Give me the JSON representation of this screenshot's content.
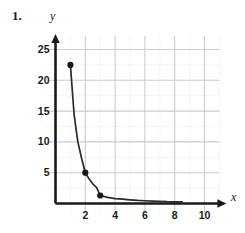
{
  "problem": {
    "number": "1."
  },
  "chart_data": {
    "type": "line",
    "title": "",
    "subtitle": "",
    "xlabel": "x",
    "ylabel": "y",
    "xlim": [
      0,
      11
    ],
    "ylim": [
      0,
      27
    ],
    "grid": true,
    "grid_major_x_step": 2,
    "grid_major_y_step": 5,
    "grid_minor_x_step": 1,
    "grid_minor_y_step": 2.5,
    "legend": "none",
    "xticks": [
      "2",
      "4",
      "6",
      "8",
      "10"
    ],
    "xtick_values": [
      2,
      4,
      6,
      8,
      10
    ],
    "yticks": [
      "5",
      "10",
      "15",
      "20",
      "25"
    ],
    "ytick_values": [
      5,
      10,
      15,
      20,
      25
    ],
    "series": [
      {
        "name": "inverse square decay",
        "equation": "y = 22.5 / x^2",
        "x": [
          1,
          1.25,
          1.5,
          1.75,
          2,
          2.25,
          2.5,
          2.75,
          3,
          3.5,
          4,
          4.5,
          5,
          5.5,
          6,
          6.5,
          7,
          7.5,
          8,
          8.5
        ],
        "y": [
          22.5,
          14.4,
          10.0,
          7.35,
          5.0,
          4.0,
          3.2,
          2.6,
          1.3,
          1.0,
          0.8,
          0.7,
          0.6,
          0.5,
          0.45,
          0.4,
          0.35,
          0.3,
          0.28,
          0.25
        ],
        "markers": [
          {
            "x": 1,
            "y": 22.5,
            "label": ""
          },
          {
            "x": 2,
            "y": 5,
            "label": ""
          },
          {
            "x": 3,
            "y": 1.3,
            "label": ""
          }
        ]
      }
    ]
  },
  "colors": {
    "curve": "#2b2b2b",
    "axis": "#1a1a1a",
    "grid_major": "#c9ccd4",
    "grid_minor": "#e2e4ea",
    "marker": "#1a1a1a",
    "background": "#ffffff",
    "text": "#1a1a1a"
  },
  "icons": {
    "y_arrow": "axis-arrow-up-icon",
    "x_arrow": "axis-arrow-right-icon"
  }
}
